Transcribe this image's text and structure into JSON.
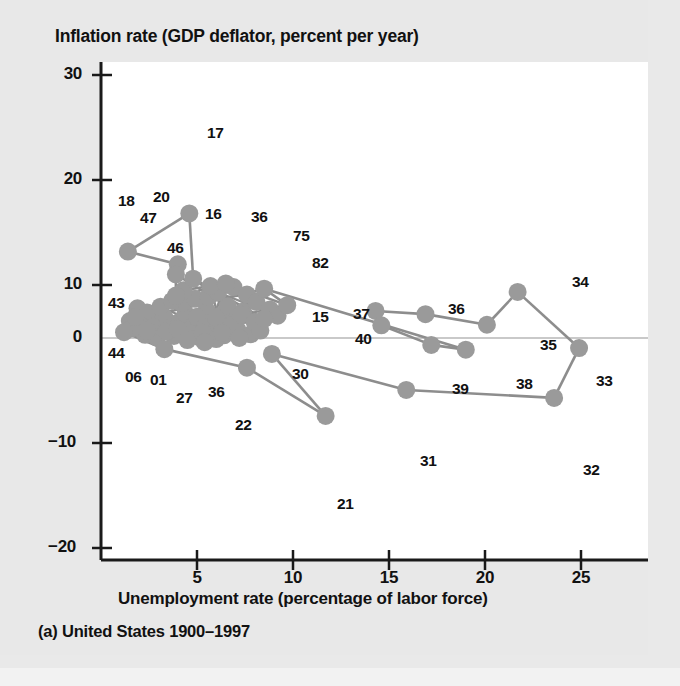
{
  "figure": {
    "title": "Inflation rate (GDP deflator, percent per year)",
    "xlabel": "Unemployment rate (percentage of labor force)",
    "caption": "(a) United States 1900–1997",
    "marker_color": "#9a9a9a",
    "line_color": "#8d8d8d",
    "axis_color": "#1a1a1a",
    "plot_background": "#ffffff",
    "page_background": "#e8e8e8"
  },
  "chart_data": {
    "type": "scatter",
    "title": "Inflation rate (GDP deflator, percent per year)",
    "subtitle": "(a) United States 1900–1997",
    "xlabel": "Unemployment rate (percentage of labor force)",
    "ylabel": "Inflation rate (GDP deflator, percent per year)",
    "xlim": [
      0,
      26.5
    ],
    "ylim": [
      -20,
      30
    ],
    "xticks": [
      5,
      10,
      15,
      20,
      25
    ],
    "yticks": [
      30,
      20,
      10,
      0,
      -10,
      -20
    ],
    "grid": false,
    "legend": "none",
    "connected": true,
    "zero_line": true,
    "annotations_note": "Each marker is a year labeled by its two-digit year; consecutive years are connected.",
    "points": [
      {
        "label": "06",
        "x": 1.7,
        "y": 2.0
      },
      {
        "label": "01",
        "x": 2.4,
        "y": 1.4
      },
      {
        "label": "15",
        "x": 8.5,
        "y": 3.6
      },
      {
        "label": "16",
        "x": 4.8,
        "y": 11.2
      },
      {
        "label": "17",
        "x": 4.6,
        "y": 23.5
      },
      {
        "label": "18",
        "x": 1.4,
        "y": 16.3
      },
      {
        "label": "20",
        "x": 4.0,
        "y": 13.9
      },
      {
        "label": "21",
        "x": 11.7,
        "y": -14.7
      },
      {
        "label": "22",
        "x": 7.6,
        "y": -5.6
      },
      {
        "label": "27",
        "x": 3.3,
        "y": -2.1
      },
      {
        "label": "30",
        "x": 8.9,
        "y": -3.0
      },
      {
        "label": "31",
        "x": 15.9,
        "y": -9.8
      },
      {
        "label": "32",
        "x": 23.6,
        "y": -11.3
      },
      {
        "label": "33",
        "x": 24.9,
        "y": -1.9
      },
      {
        "label": "34",
        "x": 21.7,
        "y": 8.7
      },
      {
        "label": "35",
        "x": 20.1,
        "y": 2.5
      },
      {
        "label": "36",
        "x": 16.9,
        "y": 4.5
      },
      {
        "label": "36b",
        "x": 6.5,
        "y": 10.3
      },
      {
        "label": "36c",
        "x": 5.4,
        "y": -0.8
      },
      {
        "label": "37",
        "x": 14.3,
        "y": 5.1
      },
      {
        "label": "38",
        "x": 19.0,
        "y": -2.2
      },
      {
        "label": "39",
        "x": 17.2,
        "y": -1.3
      },
      {
        "label": "40",
        "x": 14.6,
        "y": 2.4
      },
      {
        "label": "43",
        "x": 1.8,
        "y": 4.0
      },
      {
        "label": "44",
        "x": 1.2,
        "y": 1.1
      },
      {
        "label": "46",
        "x": 3.9,
        "y": 8.0
      },
      {
        "label": "47",
        "x": 3.9,
        "y": 12.0
      },
      {
        "label": "75",
        "x": 8.5,
        "y": 9.3
      },
      {
        "label": "82",
        "x": 9.7,
        "y": 6.2
      }
    ],
    "cluster_points": [
      {
        "x": 2.1,
        "y": 3.0
      },
      {
        "x": 2.6,
        "y": 3.4
      },
      {
        "x": 3.0,
        "y": 2.6
      },
      {
        "x": 3.3,
        "y": 3.9
      },
      {
        "x": 3.6,
        "y": 1.9
      },
      {
        "x": 4.1,
        "y": 3.1
      },
      {
        "x": 4.4,
        "y": 4.6
      },
      {
        "x": 4.8,
        "y": 2.2
      },
      {
        "x": 5.2,
        "y": 3.6
      },
      {
        "x": 5.5,
        "y": 5.2
      },
      {
        "x": 5.9,
        "y": 2.8
      },
      {
        "x": 6.2,
        "y": 4.2
      },
      {
        "x": 6.6,
        "y": 6.0
      },
      {
        "x": 7.0,
        "y": 3.3
      },
      {
        "x": 7.4,
        "y": 5.0
      },
      {
        "x": 2.3,
        "y": 0.6
      },
      {
        "x": 2.9,
        "y": 0.1
      },
      {
        "x": 3.8,
        "y": 0.4
      },
      {
        "x": 4.6,
        "y": 0.9
      },
      {
        "x": 5.1,
        "y": 0.2
      },
      {
        "x": 5.8,
        "y": 1.2
      },
      {
        "x": 6.4,
        "y": 0.5
      },
      {
        "x": 7.1,
        "y": 1.6
      },
      {
        "x": 7.8,
        "y": 0.7
      },
      {
        "x": 1.9,
        "y": 5.6
      },
      {
        "x": 2.4,
        "y": 4.8
      },
      {
        "x": 3.1,
        "y": 5.9
      },
      {
        "x": 4.2,
        "y": 6.6
      },
      {
        "x": 4.9,
        "y": 7.4
      },
      {
        "x": 5.6,
        "y": 7.8
      },
      {
        "x": 6.1,
        "y": 8.6
      },
      {
        "x": 6.9,
        "y": 9.6
      },
      {
        "x": 7.6,
        "y": 8.2
      },
      {
        "x": 8.1,
        "y": 6.8
      },
      {
        "x": 8.8,
        "y": 5.4
      },
      {
        "x": 9.2,
        "y": 4.2
      },
      {
        "x": 5.0,
        "y": 4.0
      },
      {
        "x": 5.4,
        "y": 2.0
      },
      {
        "x": 6.0,
        "y": 3.8
      },
      {
        "x": 6.8,
        "y": 2.4
      },
      {
        "x": 7.3,
        "y": 4.4
      },
      {
        "x": 8.0,
        "y": 3.0
      },
      {
        "x": 2.7,
        "y": 2.1
      },
      {
        "x": 3.4,
        "y": 1.2
      },
      {
        "x": 4.0,
        "y": 1.7
      },
      {
        "x": 4.5,
        "y": -0.4
      },
      {
        "x": 5.3,
        "y": 1.0
      },
      {
        "x": 6.0,
        "y": -0.2
      },
      {
        "x": 1.5,
        "y": 3.2
      },
      {
        "x": 1.6,
        "y": 1.8
      },
      {
        "x": 2.0,
        "y": 2.5
      },
      {
        "x": 3.7,
        "y": 7.0
      },
      {
        "x": 4.3,
        "y": 9.0
      },
      {
        "x": 5.7,
        "y": 9.8
      },
      {
        "x": 6.3,
        "y": 1.0
      },
      {
        "x": 7.2,
        "y": 0.0
      },
      {
        "x": 8.3,
        "y": 1.4
      }
    ],
    "path_order": [
      "06",
      "01",
      "15",
      "16",
      "17",
      "18",
      "20",
      "47",
      "46",
      "43",
      "44",
      "27",
      "22",
      "21",
      "30",
      "31",
      "32",
      "33",
      "34",
      "35",
      "36",
      "37",
      "40",
      "39",
      "38",
      "75",
      "82",
      "36b",
      "36c"
    ]
  },
  "axes": {
    "y_tick_labels": [
      "30",
      "20",
      "10",
      "0",
      "−10",
      "−20"
    ],
    "x_tick_labels": [
      "5",
      "10",
      "15",
      "20",
      "25"
    ]
  },
  "point_labels": {
    "l17": "17",
    "l18": "18",
    "l20": "20",
    "l47": "47",
    "l16": "16",
    "l36a": "36",
    "l75": "75",
    "l46": "46",
    "l82": "82",
    "l43": "43",
    "l15": "15",
    "l44": "44",
    "l06": "06",
    "l01": "01",
    "l27": "27",
    "l36b": "36",
    "l30": "30",
    "l22": "22",
    "l37": "37",
    "l40": "40",
    "l36c": "36",
    "l34": "34",
    "l35": "35",
    "l39": "39",
    "l38": "38",
    "l33": "33",
    "l31": "31",
    "l32": "32",
    "l21": "21"
  }
}
